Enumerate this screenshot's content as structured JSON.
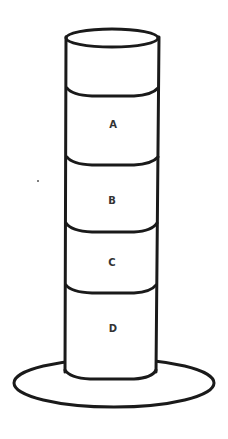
{
  "diagram": {
    "type": "layered-column",
    "layers": [
      {
        "label": "A",
        "position": "top layer"
      },
      {
        "label": "B",
        "position": "second layer"
      },
      {
        "label": "C",
        "position": "third layer"
      },
      {
        "label": "D",
        "position": "bottom layer"
      }
    ],
    "colors": {
      "line": "#1a1a1a",
      "label": "#333333",
      "background": "#ffffff"
    }
  }
}
